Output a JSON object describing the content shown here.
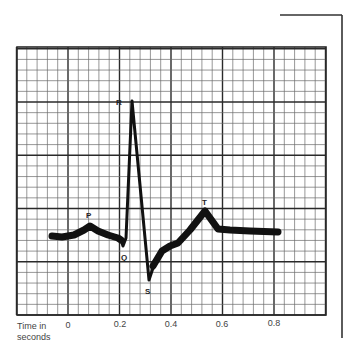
{
  "figure": {
    "title": "",
    "axis_title_line1": "Time in",
    "axis_title_line2": "seconds",
    "x_ticks": [
      "0",
      "0.2",
      "0.4",
      "0.6",
      "0.8"
    ],
    "wave_labels": {
      "P": "P",
      "Q": "Q",
      "R": "R",
      "S": "S",
      "T": "T"
    }
  },
  "chart_data": {
    "type": "line",
    "xlabel": "Time in seconds",
    "ylabel": "",
    "x_ticks": [
      0,
      0.2,
      0.4,
      0.6,
      0.8
    ],
    "grid": "ECG paper: small squares 0.04 s, large squares 0.2 s",
    "annotations": [
      "P",
      "Q",
      "R",
      "S",
      "T"
    ],
    "points": [
      {
        "t": -0.07,
        "v": 0.0
      },
      {
        "t": 0.08,
        "v": 0.2,
        "label": "P"
      },
      {
        "t": 0.2,
        "v": -0.05
      },
      {
        "t": 0.21,
        "v": -0.2,
        "label": "Q"
      },
      {
        "t": 0.245,
        "v": 2.6,
        "label": "R"
      },
      {
        "t": 0.31,
        "v": -0.85,
        "label": "S"
      },
      {
        "t": 0.36,
        "v": -0.25
      },
      {
        "t": 0.42,
        "v": -0.1
      },
      {
        "t": 0.53,
        "v": 0.45,
        "label": "T"
      },
      {
        "t": 0.58,
        "v": 0.1
      },
      {
        "t": 0.81,
        "v": 0.07
      }
    ]
  },
  "colors": {
    "grid_minor": "#6a6a6a",
    "grid_major": "#2a2a2a",
    "trace": "#111111",
    "bracket": "#333333"
  }
}
